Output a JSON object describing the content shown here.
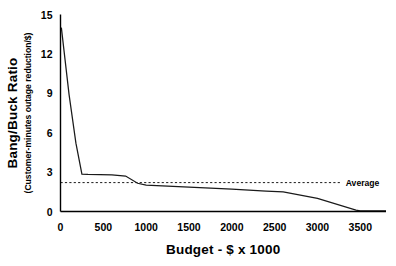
{
  "chart_data": {
    "type": "line",
    "title": "",
    "xlabel": "Budget - $ x 1000",
    "ylabel": "Bang/Buck Ratio",
    "ylabel_sub": "(Customer-minutes outage reduction/$)",
    "xlim": [
      0,
      3800
    ],
    "ylim": [
      0,
      15
    ],
    "xticks": [
      0,
      500,
      1000,
      1500,
      2000,
      2500,
      3000,
      3500
    ],
    "xtick_labels": [
      "0",
      "500",
      "1000",
      "1500",
      "2000",
      "2500",
      "3000",
      "3500"
    ],
    "yticks": [
      0,
      3,
      6,
      9,
      12,
      15
    ],
    "ytick_labels": [
      "0",
      "3",
      "6",
      "9",
      "12",
      "15"
    ],
    "grid": false,
    "legend": false,
    "series": [
      {
        "name": "Bang/Buck Ratio",
        "color": "#1a1a1a",
        "style": "solid",
        "x": [
          10,
          100,
          180,
          250,
          320,
          600,
          760,
          900,
          1000,
          1500,
          2000,
          2400,
          2600,
          3000,
          3450,
          3500,
          3800
        ],
        "y": [
          14.0,
          8.9,
          5.2,
          2.85,
          2.82,
          2.78,
          2.7,
          2.15,
          2.0,
          1.85,
          1.7,
          1.55,
          1.5,
          1.0,
          0.1,
          0.05,
          0.05
        ]
      }
    ],
    "annotations": [
      {
        "name": "average-line",
        "type": "hline",
        "value": 2.2,
        "label": "Average",
        "style": "dashed",
        "color": "#1a1a1a",
        "x_start": 0,
        "x_end": 3280,
        "label_x": 3330,
        "label_y": 2.2
      }
    ]
  },
  "axes": {
    "x_title": "Budget - $ x 1000",
    "y_title": "Bang/Buck Ratio",
    "y_subtitle": "(Customer-minutes outage reduction/$)"
  }
}
